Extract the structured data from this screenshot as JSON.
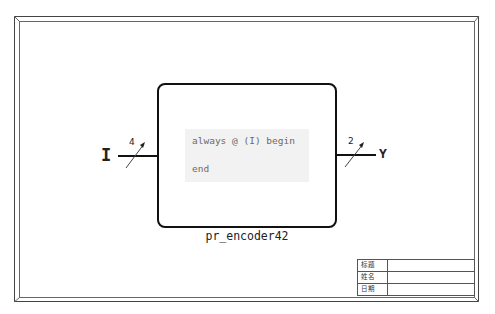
{
  "diagram": {
    "type": "verilog-module-block",
    "module": {
      "name": "pr_encoder42",
      "code_lines": [
        "always @ (I) begin",
        "end"
      ]
    },
    "ports": {
      "input": {
        "name": "I",
        "width": "4"
      },
      "output": {
        "name": "Y",
        "width": "2"
      }
    },
    "title_block": {
      "rows": [
        {
          "label": "标题",
          "value": ""
        },
        {
          "label": "姓名",
          "value": ""
        },
        {
          "label": "日期",
          "value": ""
        }
      ]
    }
  }
}
